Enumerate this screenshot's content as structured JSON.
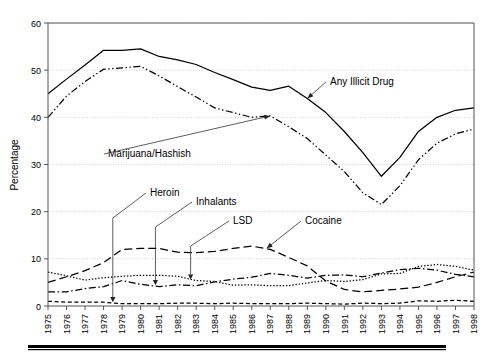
{
  "chart_data": {
    "type": "line",
    "title": "",
    "xlabel": "",
    "ylabel": "Percentage",
    "ylim": [
      0,
      60
    ],
    "yticks": [
      0,
      10,
      20,
      30,
      40,
      50,
      60
    ],
    "ytick_labels": [
      "0",
      "10",
      "20",
      "30",
      "40",
      "50",
      "60"
    ],
    "grid": true,
    "legend_position": "inline-annotations",
    "x": [
      1975,
      1976,
      1977,
      1978,
      1979,
      1980,
      1981,
      1982,
      1983,
      1984,
      1985,
      1986,
      1987,
      1988,
      1989,
      1990,
      1991,
      1992,
      1993,
      1994,
      1995,
      1996,
      1997,
      1998
    ],
    "xtick_labels": [
      "1975",
      "1976",
      "1977",
      "1978",
      "1979",
      "1980",
      "1981",
      "1982",
      "1983",
      "1984",
      "1985",
      "1986",
      "1987",
      "1988",
      "1989",
      "1990",
      "1991",
      "1992",
      "1993",
      "1994",
      "1995",
      "1996",
      "1997",
      "1998"
    ],
    "series": [
      {
        "name": "Any Illicit Drug",
        "style": "solid",
        "values": [
          45.0,
          48.1,
          51.1,
          54.2,
          54.2,
          54.5,
          52.9,
          52.2,
          51.2,
          49.5,
          48.0,
          46.4,
          45.7,
          46.6,
          44.0,
          41.0,
          37.0,
          32.5,
          27.5,
          31.5,
          37.0,
          40.0,
          41.5,
          42.0
        ]
      },
      {
        "name": "Marijuana/Hashish",
        "style": "dash-dot-dot",
        "values": [
          40.0,
          44.5,
          47.6,
          50.2,
          50.5,
          50.8,
          48.8,
          46.5,
          44.3,
          42.0,
          41.0,
          40.0,
          40.3,
          38.0,
          35.5,
          32.0,
          28.5,
          24.0,
          21.5,
          25.5,
          31.0,
          34.5,
          36.5,
          37.5
        ]
      },
      {
        "name": "Cocaine",
        "style": "long-dash",
        "values": [
          5.0,
          6.2,
          7.5,
          9.2,
          12.0,
          12.2,
          12.2,
          11.4,
          11.3,
          11.6,
          12.2,
          12.7,
          12.0,
          10.3,
          8.5,
          5.3,
          3.5,
          3.0,
          3.3,
          3.6,
          4.0,
          5.0,
          6.2,
          7.2
        ]
      },
      {
        "name": "LSD",
        "style": "dotted",
        "values": [
          7.2,
          6.4,
          5.5,
          6.0,
          6.3,
          6.5,
          6.5,
          6.3,
          5.4,
          5.2,
          4.4,
          4.5,
          4.3,
          4.3,
          4.9,
          5.4,
          5.2,
          5.6,
          6.8,
          6.9,
          8.4,
          8.8,
          8.4,
          7.6
        ]
      },
      {
        "name": "Inhalants",
        "style": "dash-dot",
        "values": [
          3.0,
          3.0,
          3.7,
          4.1,
          5.4,
          4.6,
          4.1,
          4.5,
          4.3,
          5.1,
          5.7,
          6.1,
          6.9,
          6.5,
          5.9,
          6.5,
          6.6,
          6.2,
          7.0,
          7.7,
          8.0,
          7.6,
          6.7,
          6.2
        ]
      },
      {
        "name": "Heroin",
        "style": "short-dash",
        "values": [
          1.0,
          0.8,
          0.8,
          0.8,
          0.5,
          0.5,
          0.5,
          0.6,
          0.6,
          0.5,
          0.6,
          0.5,
          0.5,
          0.5,
          0.6,
          0.5,
          0.4,
          0.6,
          0.5,
          0.6,
          1.1,
          1.0,
          1.2,
          1.0
        ]
      }
    ],
    "annotations": [
      {
        "label": "Any Illicit Drug",
        "target_year": 1989,
        "target_value": 44.0
      },
      {
        "label": "Marijuana/Hashish",
        "target_year": 1987,
        "target_value": 40.3
      },
      {
        "label": "Heroin",
        "target_year": 1978.5,
        "target_value": 0.8
      },
      {
        "label": "Inhalants",
        "target_year": 1980.8,
        "target_value": 4.4
      },
      {
        "label": "LSD",
        "target_year": 1982.7,
        "target_value": 5.6
      },
      {
        "label": "Cocaine",
        "target_year": 1986.8,
        "target_value": 12.2
      }
    ]
  },
  "axes": {
    "ylabel": "Percentage"
  }
}
